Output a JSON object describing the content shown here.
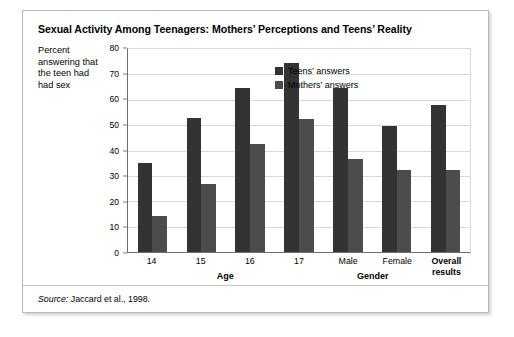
{
  "chart_data": {
    "type": "bar",
    "title": "Sexual Activity Among Teenagers: Mothers’ Perceptions and Teens’ Reality",
    "ylabel": "Percent answering that the teen had had sex",
    "xlabel": "",
    "ylim": [
      0,
      80
    ],
    "yticks": [
      0,
      10,
      20,
      30,
      40,
      50,
      60,
      70,
      80
    ],
    "grid": true,
    "legend_position": "inside top-right",
    "categories": [
      "14",
      "15",
      "16",
      "17",
      "Male",
      "Female",
      "Overall results"
    ],
    "category_labels": [
      {
        "text": "14",
        "bold": false
      },
      {
        "text": "15",
        "bold": false
      },
      {
        "text": "16",
        "bold": false
      },
      {
        "text": "17",
        "bold": false
      },
      {
        "text": "Male",
        "bold": false
      },
      {
        "text": "Female",
        "bold": false
      },
      {
        "text": "Overall\nresults",
        "bold": true
      }
    ],
    "group_labels": [
      {
        "text": "Age",
        "spans": [
          "14",
          "15",
          "16",
          "17"
        ]
      },
      {
        "text": "Gender",
        "spans": [
          "Male",
          "Female"
        ]
      }
    ],
    "series": [
      {
        "name": "Teens’ answers",
        "color": "#333333",
        "values": [
          35,
          53,
          64.5,
          74.5,
          64.5,
          49.5,
          58
        ]
      },
      {
        "name": "Mothers’ answers",
        "color": "#4c4c4c",
        "values": [
          14,
          27,
          42.5,
          52.5,
          36.5,
          32.5,
          32.5
        ]
      }
    ],
    "source": {
      "prefix": "Source:",
      "text": "Jaccard et al., 1998."
    }
  }
}
